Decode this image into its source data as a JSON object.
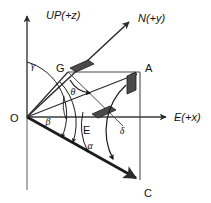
{
  "figure": {
    "background_color": "#ffffff",
    "line_color": "#2b2b2b",
    "marker_fill": "#4a4a4a",
    "width": 211,
    "height": 203
  },
  "axes": [
    {
      "id": "up",
      "label": "UP(+z)",
      "direction": "vertical-up",
      "origin": [
        27,
        117
      ],
      "tip": [
        27,
        14
      ]
    },
    {
      "id": "east",
      "label": "E(+x)",
      "direction": "horizontal-right",
      "origin": [
        27,
        117
      ],
      "tip": [
        168,
        117
      ]
    },
    {
      "id": "north",
      "label": "N(+y)",
      "direction": "diagonal-up-right",
      "origin": [
        27,
        117
      ],
      "tip": [
        131,
        20
      ]
    }
  ],
  "points": [
    {
      "id": "O",
      "label": "O",
      "x": 27,
      "y": 117,
      "label_x": 12,
      "label_y": 121
    },
    {
      "id": "G",
      "label": "G",
      "x": 68,
      "y": 72,
      "label_x": 59,
      "label_y": 70
    },
    {
      "id": "A",
      "label": "A",
      "x": 140,
      "y": 72,
      "label_x": 145,
      "label_y": 70
    },
    {
      "id": "E",
      "label": "E",
      "x": 90,
      "y": 117,
      "label_x": 84,
      "label_y": 132
    },
    {
      "id": "C",
      "label": "C",
      "x": 140,
      "y": 180,
      "label_x": 145,
      "label_y": 196
    }
  ],
  "angles": [
    {
      "id": "gamma",
      "label": "γ",
      "label_x": 33,
      "label_y": 67,
      "description": "angle from UP axis to ON direction"
    },
    {
      "id": "theta",
      "label": "θ",
      "label_x": 73,
      "label_y": 92,
      "description": "angle at G between GO and GA"
    },
    {
      "id": "beta",
      "label": "β",
      "label_x": 48,
      "label_y": 123,
      "description": "angle from OE axis up to OA"
    },
    {
      "id": "alpha",
      "label": "α",
      "label_x": 89,
      "label_y": 147,
      "description": "angle from OE axis down to OC"
    },
    {
      "id": "delta",
      "label": "δ",
      "label_x": 122,
      "label_y": 131,
      "description": "angle at vertical line from A down to C"
    }
  ],
  "segments": [
    {
      "id": "OG-ON",
      "from": "O",
      "to": "N-tip",
      "style": "solid-arrow"
    },
    {
      "id": "OA",
      "from": "O",
      "to": "A",
      "style": "solid-arrow"
    },
    {
      "id": "OE",
      "from": "O",
      "to": "E",
      "style": "solid"
    },
    {
      "id": "OC",
      "from": "O",
      "to": "C",
      "style": "thick-arrow"
    },
    {
      "id": "GA",
      "from": "G",
      "to": "A",
      "style": "solid"
    },
    {
      "id": "AC",
      "from": "A",
      "to": "C",
      "style": "solid-vertical"
    },
    {
      "id": "GE",
      "from": "G",
      "to": "E",
      "style": "solid"
    }
  ],
  "right_angle_markers": [
    {
      "id": "marker-at-G",
      "x": 76,
      "y": 66,
      "description": "filled parallelogram right-angle mark near G on ON line"
    },
    {
      "id": "marker-at-A",
      "x": 130,
      "y": 76,
      "description": "filled parallelogram right-angle mark at A on AC line"
    },
    {
      "id": "marker-at-E",
      "x": 100,
      "y": 110,
      "description": "filled parallelogram right-angle mark near E on OE axis"
    }
  ]
}
